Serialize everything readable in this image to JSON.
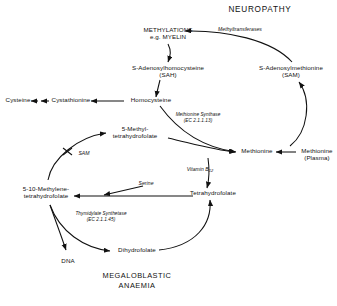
{
  "figure": {
    "type": "biochemical-pathway-diagram",
    "title_top": "NEUROPATHY",
    "title_bottom_line1": "MEGALOBLASTIC",
    "title_bottom_line2": "ANAEMIA"
  },
  "nodes": {
    "methylations": {
      "line1": "METHYLATIONS",
      "line2": "e.g. MYELIN"
    },
    "sah": {
      "line1": "S-Adenosylhomocysteine",
      "line2": "(SAH)"
    },
    "sam": {
      "line1": "S-Adenosylmethionine",
      "line2": "(SAM)"
    },
    "cysteine": {
      "line1": "Cysteine"
    },
    "cystathionine": {
      "line1": "Cystathionine"
    },
    "homocysteine": {
      "line1": "Homocysteine"
    },
    "methyl_thf": {
      "line1": "5-Methyl-",
      "line2": "tetrahydrofolate"
    },
    "methionine": {
      "line1": "Methionine"
    },
    "methionine_plasma": {
      "line1": "Methionine",
      "line2": "(Plasma)"
    },
    "methylene_thf": {
      "line1": "5-10-Methylene-",
      "line2": "tetrahydrofolate"
    },
    "thf": {
      "line1": "Tetrahydrofolate"
    },
    "dihydrofolate": {
      "line1": "Dihydrofolate"
    },
    "dna": {
      "line1": "DNA"
    }
  },
  "annotations": {
    "methyltransferases": "Methyltransferases",
    "methionine_synthase_name": "Methionine Synthase",
    "methionine_synthase_ec": "(EC 2.1.1.13)",
    "thymidylate_synthetase_name": "Thymidylate Synthetase",
    "thymidylate_synthetase_ec": "(EC 2.1.1.45)",
    "sam_inhibition": "SAM",
    "vitamin_b12_label": "Vitamin B",
    "vitamin_b12_sub": "12",
    "serine": "Serine"
  },
  "colors": {
    "ink": "#111111",
    "background": "#ffffff"
  }
}
